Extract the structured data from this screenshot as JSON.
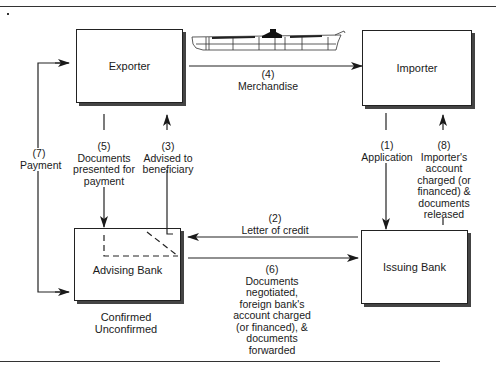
{
  "diagram": {
    "type": "letter-of-credit-flow",
    "nodes": {
      "exporter": "Exporter",
      "importer": "Importer",
      "advising_bank": "Advising Bank",
      "issuing_bank": "Issuing Bank"
    },
    "advising_bank_caption": [
      "Confirmed",
      "Unconfirmed"
    ],
    "flows": [
      {
        "step": "(1)",
        "lines": [
          "Application"
        ],
        "from": "Importer",
        "to": "Issuing Bank"
      },
      {
        "step": "(2)",
        "lines": [
          "Letter of credit"
        ],
        "from": "Issuing Bank",
        "to": "Advising Bank"
      },
      {
        "step": "(3)",
        "lines": [
          "Advised to",
          "beneficiary"
        ],
        "from": "Advising Bank",
        "to": "Exporter"
      },
      {
        "step": "(4)",
        "lines": [
          "Merchandise"
        ],
        "from": "Exporter",
        "to": "Importer"
      },
      {
        "step": "(5)",
        "lines": [
          "Documents",
          "presented for",
          "payment"
        ],
        "from": "Exporter",
        "to": "Advising Bank"
      },
      {
        "step": "(6)",
        "lines": [
          "Documents",
          "negotiated,",
          "foreign bank's",
          "account charged",
          "(or financed), &",
          "documents",
          "forwarded"
        ],
        "from": "Advising Bank",
        "to": "Issuing Bank"
      },
      {
        "step": "(7)",
        "lines": [
          "Payment"
        ],
        "from": "Advising Bank",
        "to": "Exporter"
      },
      {
        "step": "(8)",
        "lines": [
          "Importer's",
          "account",
          "charged (or",
          "financed) &",
          "documents",
          "released"
        ],
        "from": "Issuing Bank",
        "to": "Importer"
      }
    ],
    "icons": [
      "cargo-ship-icon"
    ]
  },
  "labels": {
    "f1_step": "(1)",
    "f1_text": "Application",
    "f2_step": "(2)",
    "f2_text": "Letter of credit",
    "f3_step": "(3)",
    "f3_l1": "Advised to",
    "f3_l2": "beneficiary",
    "f4_step": "(4)",
    "f4_text": "Merchandise",
    "f5_step": "(5)",
    "f5_l1": "Documents",
    "f5_l2": "presented for",
    "f5_l3": "payment",
    "f6_step": "(6)",
    "f6_l1": "Documents",
    "f6_l2": "negotiated,",
    "f6_l3": "foreign bank's",
    "f6_l4": "account charged",
    "f6_l5": "(or financed), &",
    "f6_l6": "documents",
    "f6_l7": "forwarded",
    "f7_step": "(7)",
    "f7_text": "Payment",
    "f8_step": "(8)",
    "f8_l1": "Importer's",
    "f8_l2": "account",
    "f8_l3": "charged (or",
    "f8_l4": "financed) &",
    "f8_l5": "documents",
    "f8_l6": "released",
    "caption_1": "Confirmed",
    "caption_2": "Unconfirmed"
  }
}
